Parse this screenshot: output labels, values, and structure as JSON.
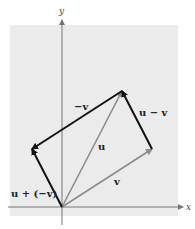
{
  "figure": {
    "type": "vector-diagram",
    "axes": {
      "x_label": "x",
      "y_label": "y"
    },
    "colors": {
      "panel": "#ebebeb",
      "axis": "#777777",
      "dark_vector": "#111111",
      "gray_vector": "#8c8c8c"
    },
    "vectors": [
      {
        "id": "u",
        "label": "u",
        "from": "origin",
        "to": "u",
        "style": "gray"
      },
      {
        "id": "v",
        "label": "v",
        "from": "origin",
        "to": "v",
        "style": "gray"
      },
      {
        "id": "neg-v",
        "label": "−v",
        "from": "u",
        "to": "u_minus_v",
        "style": "dark"
      },
      {
        "id": "u-minus-v",
        "label": "u − v",
        "from": "v",
        "to": "u",
        "style": "dark"
      },
      {
        "id": "u-plus-neg-v",
        "label": "u + (−v)",
        "from": "origin",
        "to": "u_minus_v",
        "style": "dark"
      }
    ],
    "points": {
      "origin": [
        0,
        0
      ],
      "v": [
        3,
        2
      ],
      "u": [
        2,
        4
      ],
      "u_minus_v": [
        -1,
        2
      ]
    }
  }
}
